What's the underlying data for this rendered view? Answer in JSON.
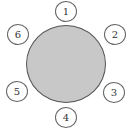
{
  "diagram": {
    "type": "round-table-seating",
    "table": {
      "fill": "#c8c8c8",
      "stroke": "#555555"
    },
    "seats": [
      {
        "label": "1",
        "x": 55,
        "y": 1
      },
      {
        "label": "2",
        "x": 104,
        "y": 24
      },
      {
        "label": "3",
        "x": 103,
        "y": 82
      },
      {
        "label": "4",
        "x": 55,
        "y": 107
      },
      {
        "label": "5",
        "x": 6,
        "y": 81
      },
      {
        "label": "6",
        "x": 7,
        "y": 24
      }
    ]
  }
}
